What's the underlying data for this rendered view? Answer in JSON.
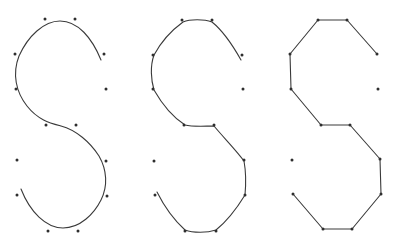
{
  "diagram": {
    "colors": {
      "background": "#ffffff",
      "stroke": "#3a3a3a",
      "point": "#2e2e2e"
    },
    "panels": [
      {
        "id": "smooth-spline",
        "style": "loose-smooth-curve",
        "control_points": [
          [
            45,
            19
          ],
          [
            75,
            19
          ],
          [
            15,
            54
          ],
          [
            104,
            54
          ],
          [
            16,
            89
          ],
          [
            106,
            89
          ],
          [
            46,
            125
          ],
          [
            76,
            125
          ],
          [
            17,
            160
          ],
          [
            106,
            161
          ],
          [
            17,
            195
          ],
          [
            107,
            196
          ],
          [
            48,
            231
          ],
          [
            78,
            231
          ]
        ],
        "path": "M101,60 C92,38 78,21 60,21 C44,21 28,36 19,56 C12,74 16,92 27,106 C38,120 50,123 61,126 C76,130 90,142 99,156 C107,170 108,186 101,200 C94,214 80,228 63,228 C46,228 30,212 21,189"
      },
      {
        "id": "tight-spline",
        "style": "tight-curve",
        "control_points": [
          [
            182,
            20
          ],
          [
            212,
            20
          ],
          [
            153,
            55
          ],
          [
            242,
            55
          ],
          [
            153,
            89
          ],
          [
            243,
            89
          ],
          [
            184,
            125
          ],
          [
            214,
            125
          ],
          [
            154,
            161
          ],
          [
            244,
            160
          ],
          [
            155,
            195
          ],
          [
            245,
            195
          ],
          [
            185,
            231
          ],
          [
            216,
            231
          ]
        ],
        "path": "M241,60 C232,44 222,30 212,22 C204,19 190,19 183,22 C172,30 161,42 154,55 C150,66 151,80 154,90 C162,104 174,118 185,125 C193,127 205,126 214,126 C224,138 236,150 244,161 C246,172 246,184 245,195 C237,208 226,222 216,230 C207,233 193,233 185,230 C174,220 163,204 157,192"
      },
      {
        "id": "polyline",
        "style": "straight-segments",
        "control_points": [
          [
            318,
            20
          ],
          [
            347,
            20
          ],
          [
            290,
            54
          ],
          [
            377,
            54
          ],
          [
            291,
            89
          ],
          [
            378,
            89
          ],
          [
            321,
            125
          ],
          [
            350,
            125
          ],
          [
            292,
            160
          ],
          [
            380,
            159
          ],
          [
            293,
            194
          ],
          [
            381,
            194
          ],
          [
            323,
            229
          ],
          [
            352,
            229
          ]
        ],
        "path": "M377,54 L347,20 L318,20 L290,54 L291,89 L321,125 L350,125 L380,159 L381,194 L352,229 L323,229 L293,194"
      }
    ]
  }
}
